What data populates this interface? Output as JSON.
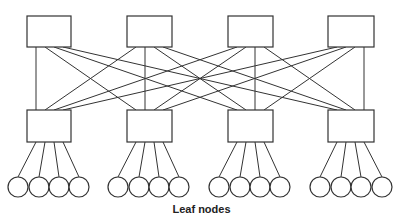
{
  "diagram": {
    "type": "spine-leaf network topology",
    "caption": "Leaf nodes",
    "colors": {
      "stroke": "#333333",
      "fill": "#ffffff",
      "text": "#222222"
    },
    "spine_switches": [
      {
        "id": "spine-1",
        "x": 27,
        "y": 16,
        "w": 44,
        "h": 31
      },
      {
        "id": "spine-2",
        "x": 127,
        "y": 16,
        "w": 45,
        "h": 31
      },
      {
        "id": "spine-3",
        "x": 228,
        "y": 16,
        "w": 45,
        "h": 31
      },
      {
        "id": "spine-4",
        "x": 328,
        "y": 16,
        "w": 46,
        "h": 31
      }
    ],
    "leaf_switches": [
      {
        "id": "leaf-switch-1",
        "x": 27,
        "y": 110,
        "w": 44,
        "h": 32
      },
      {
        "id": "leaf-switch-2",
        "x": 127,
        "y": 110,
        "w": 45,
        "h": 32
      },
      {
        "id": "leaf-switch-3",
        "x": 228,
        "y": 110,
        "w": 45,
        "h": 32
      },
      {
        "id": "leaf-switch-4",
        "x": 328,
        "y": 110,
        "w": 46,
        "h": 32
      }
    ],
    "leaf_nodes": [
      {
        "switch": 0,
        "cx": [
          18,
          39,
          59,
          79
        ]
      },
      {
        "switch": 1,
        "cx": [
          118,
          139,
          159,
          179
        ]
      },
      {
        "switch": 2,
        "cx": [
          219,
          240,
          260,
          280
        ]
      },
      {
        "switch": 3,
        "cx": [
          320,
          341,
          361,
          382
        ]
      }
    ],
    "leaf_node_cy": 187,
    "leaf_node_r": 10,
    "connections": "full mesh: every spine switch connects to every leaf switch"
  }
}
